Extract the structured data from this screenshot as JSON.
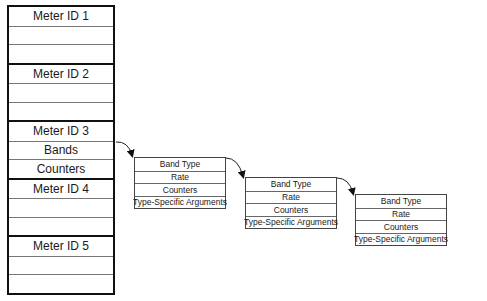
{
  "meter_table": {
    "groups": [
      {
        "rows": [
          "Meter ID 1",
          "",
          ""
        ]
      },
      {
        "rows": [
          "Meter ID 2",
          "",
          ""
        ]
      },
      {
        "rows": [
          "Meter ID 3",
          "Bands",
          "Counters"
        ]
      },
      {
        "rows": [
          "Meter ID 4",
          "",
          ""
        ]
      },
      {
        "rows": [
          "Meter ID 5",
          "",
          ""
        ]
      }
    ]
  },
  "band_boxes": [
    {
      "rows": [
        "Band Type",
        "Rate",
        "Counters",
        "Type-Specific Arguments"
      ]
    },
    {
      "rows": [
        "Band Type",
        "Rate",
        "Counters",
        "Type-Specific Arguments"
      ]
    },
    {
      "rows": [
        "Band Type",
        "Rate",
        "Counters",
        "Type-Specific Arguments"
      ]
    }
  ]
}
